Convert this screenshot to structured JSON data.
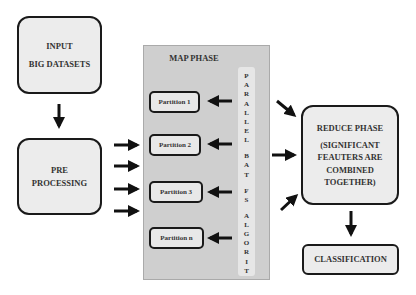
{
  "input_box": {
    "line1": "INPUT",
    "line2": "BIG DATASETS"
  },
  "preprocessing_box": {
    "line1": "PRE",
    "line2": "PROCESSING"
  },
  "map_phase": {
    "title": "MAP PHASE",
    "partitions": [
      "Partition 1",
      "Partition 2",
      "Partition 3",
      "Partition n"
    ],
    "vertical_label": [
      "P",
      "A",
      "R",
      "A",
      "L",
      "L",
      "E",
      "L",
      "",
      "B",
      "A",
      "T",
      "",
      "F",
      "S",
      "",
      "A",
      "L",
      "G",
      "O",
      "R",
      "I",
      "T",
      "H",
      "M"
    ]
  },
  "reduce_box": {
    "title": "REDUCE PHASE",
    "lines": [
      "(SIGNIFICANT",
      "FEAUTERS ARE",
      "COMBINED",
      "TOGETHER)"
    ]
  },
  "classification_box": {
    "label": "CLASSIFICATION"
  },
  "colors": {
    "box_fill": "#ececec",
    "panel_fill": "#cfcfcf",
    "stroke": "#1a1a1a"
  }
}
